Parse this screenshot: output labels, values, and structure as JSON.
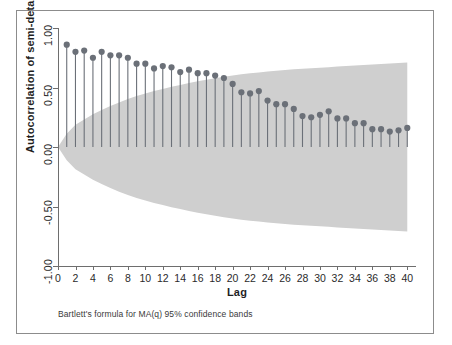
{
  "figure": {
    "background_color": "#ffffff",
    "frame_color": "#8c8c8c"
  },
  "footnote": "Bartlett's formula for MA(q) 95% confidence bands",
  "chart_data": {
    "type": "scatter",
    "title": "",
    "subtitle": "",
    "xlabel": "Lag",
    "ylabel": "Autocorrelation of semi-detached housing starts",
    "xlim": [
      0,
      41
    ],
    "ylim": [
      -1.0,
      1.0
    ],
    "grid": false,
    "legend_position": "none",
    "marker_color": "#6b7078",
    "spike_color": "#6b7078",
    "band_color": "#cfcfcf",
    "y_ticks": [
      1.0,
      0.5,
      0.0,
      -0.5,
      -1.0
    ],
    "y_tick_labels": [
      "1.00",
      "0.50",
      "0.00",
      "-0.50",
      "-1.00"
    ],
    "x_ticks": [
      0,
      2,
      4,
      6,
      8,
      10,
      12,
      14,
      16,
      18,
      20,
      22,
      24,
      26,
      28,
      30,
      32,
      34,
      36,
      38,
      40
    ],
    "x_tick_labels": [
      "0",
      "2",
      "4",
      "6",
      "8",
      "10",
      "12",
      "14",
      "16",
      "18",
      "20",
      "22",
      "24",
      "26",
      "28",
      "30",
      "32",
      "34",
      "36",
      "38",
      "40"
    ],
    "x": [
      1,
      2,
      3,
      4,
      5,
      6,
      7,
      8,
      9,
      10,
      11,
      12,
      13,
      14,
      15,
      16,
      17,
      18,
      19,
      20,
      21,
      22,
      23,
      24,
      25,
      26,
      27,
      28,
      29,
      30,
      31,
      32,
      33,
      34,
      35,
      36,
      37,
      38,
      39,
      40
    ],
    "values": [
      0.86,
      0.8,
      0.81,
      0.75,
      0.8,
      0.77,
      0.77,
      0.75,
      0.7,
      0.7,
      0.66,
      0.68,
      0.67,
      0.63,
      0.65,
      0.62,
      0.62,
      0.6,
      0.58,
      0.53,
      0.46,
      0.45,
      0.47,
      0.39,
      0.36,
      0.36,
      0.32,
      0.26,
      0.25,
      0.27,
      0.3,
      0.24,
      0.24,
      0.2,
      0.2,
      0.15,
      0.15,
      0.13,
      0.14,
      0.16
    ],
    "confidence_band": {
      "label": "Bartlett 95% confidence band",
      "upper": [
        0.112,
        0.186,
        0.232,
        0.276,
        0.31,
        0.345,
        0.375,
        0.404,
        0.429,
        0.45,
        0.47,
        0.488,
        0.506,
        0.522,
        0.537,
        0.552,
        0.565,
        0.578,
        0.59,
        0.601,
        0.611,
        0.619,
        0.627,
        0.635,
        0.641,
        0.647,
        0.653,
        0.658,
        0.662,
        0.666,
        0.671,
        0.676,
        0.681,
        0.685,
        0.689,
        0.693,
        0.697,
        0.701,
        0.705,
        0.71
      ],
      "lower": [
        -0.112,
        -0.186,
        -0.232,
        -0.276,
        -0.31,
        -0.345,
        -0.375,
        -0.404,
        -0.429,
        -0.45,
        -0.47,
        -0.488,
        -0.506,
        -0.522,
        -0.537,
        -0.552,
        -0.565,
        -0.578,
        -0.59,
        -0.601,
        -0.611,
        -0.619,
        -0.627,
        -0.635,
        -0.641,
        -0.647,
        -0.653,
        -0.658,
        -0.662,
        -0.666,
        -0.671,
        -0.676,
        -0.681,
        -0.685,
        -0.689,
        -0.693,
        -0.697,
        -0.701,
        -0.705,
        -0.71
      ]
    }
  }
}
